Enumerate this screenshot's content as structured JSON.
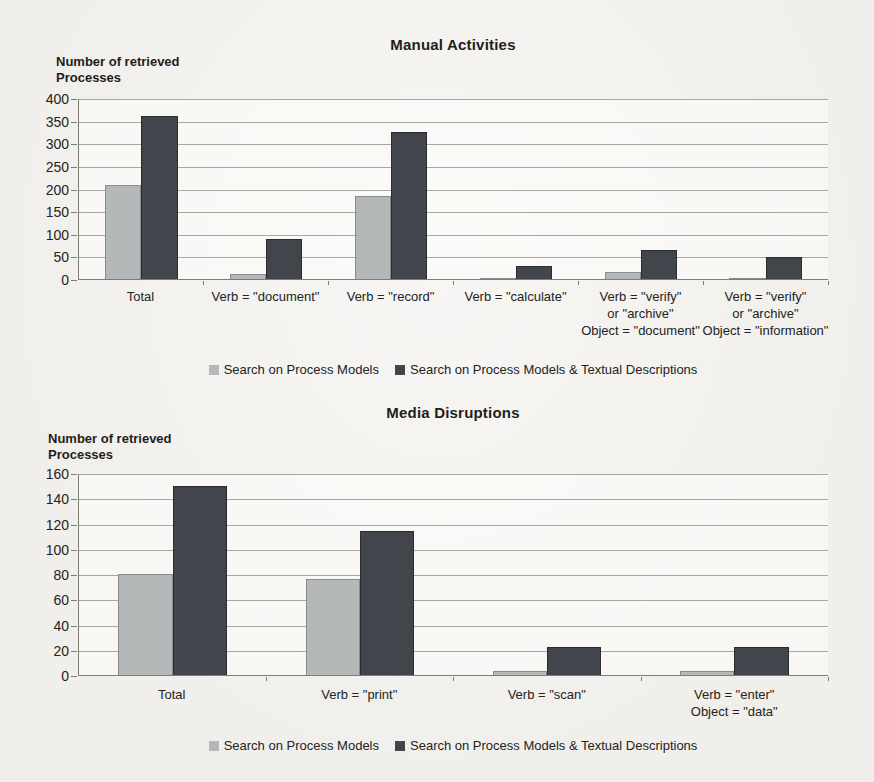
{
  "page": {
    "paper_color": "#f1efeb",
    "text_color": "#1f1e1c",
    "gridline_color": "#aaa79f",
    "axis_color": "#7f7c76"
  },
  "legend": {
    "items": [
      {
        "label": "Search on Process Models",
        "color": "#b5b8b8"
      },
      {
        "label": "Search on Process Models & Textual Descriptions",
        "color": "#42454b"
      }
    ]
  },
  "chart_data": [
    {
      "type": "bar",
      "title": "Manual Activities",
      "ylabel": "Number of retrieved\nProcesses",
      "xlabel": "",
      "ylim": [
        0,
        400
      ],
      "ytick_step": 50,
      "grid": true,
      "legend_position": "bottom",
      "categories": [
        "Total",
        "Verb = \"document\"",
        "Verb = \"record\"",
        "Verb = \"calculate\"",
        "Verb = \"verify\"\nor \"archive\"\nObject = \"document\"",
        "Verb = \"verify\"\nor \"archive\"\nObject = \"information\""
      ],
      "series": [
        {
          "name": "Search on Process Models",
          "color": "#b5b8b8",
          "values": [
            207,
            12,
            183,
            1,
            16,
            2
          ]
        },
        {
          "name": "Search on Process Models & Textual Descriptions",
          "color": "#42454b",
          "values": [
            360,
            88,
            325,
            28,
            64,
            48
          ]
        }
      ]
    },
    {
      "type": "bar",
      "title": "Media Disruptions",
      "ylabel": "Number of retrieved\nProcesses",
      "xlabel": "",
      "ylim": [
        0,
        160
      ],
      "ytick_step": 20,
      "grid": true,
      "legend_position": "bottom",
      "categories": [
        "Total",
        "Verb = \"print\"",
        "Verb = \"scan\"",
        "Verb = \"enter\"\nObject = \"data\""
      ],
      "series": [
        {
          "name": "Search on Process Models",
          "color": "#b5b8b8",
          "values": [
            80,
            76,
            3,
            3
          ]
        },
        {
          "name": "Search on Process Models & Textual Descriptions",
          "color": "#42454b",
          "values": [
            150,
            114,
            22,
            22
          ]
        }
      ]
    }
  ]
}
